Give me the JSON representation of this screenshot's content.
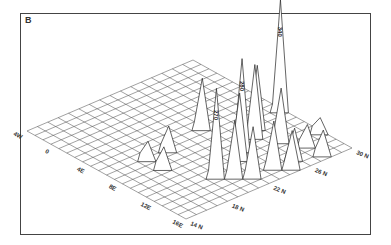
{
  "panel_label": "B",
  "chart_data": {
    "type": "3d-surface",
    "title": "",
    "panel": "B",
    "x_axis": {
      "label": "Longitude",
      "ticks": [
        "4W",
        "0",
        "4E",
        "8E",
        "12E",
        "16E"
      ],
      "range": [
        -4,
        16
      ]
    },
    "y_axis": {
      "label": "Latitude",
      "ticks": [
        "14 N",
        "18 N",
        "22 N",
        "26 N",
        "30 N"
      ],
      "range": [
        14,
        30
      ]
    },
    "labeled_peaks": [
      {
        "label": "340",
        "lon": 7,
        "lat": 30,
        "value": 340
      },
      {
        "label": "280",
        "lon": 10,
        "lat": 24,
        "value": 280
      },
      {
        "label": "270",
        "lon": 12,
        "lat": 20,
        "value": 270
      }
    ],
    "peaks": [
      {
        "lon": 7,
        "lat": 30,
        "value": 340
      },
      {
        "lon": 10,
        "lat": 24,
        "value": 280
      },
      {
        "lon": 12,
        "lat": 20,
        "value": 270
      },
      {
        "lon": 9,
        "lat": 26,
        "value": 220
      },
      {
        "lon": 8,
        "lat": 27,
        "value": 190
      },
      {
        "lon": 11,
        "lat": 23,
        "value": 200
      },
      {
        "lon": 13,
        "lat": 21,
        "value": 170
      },
      {
        "lon": 14,
        "lat": 22,
        "value": 150
      },
      {
        "lon": 14,
        "lat": 24,
        "value": 140
      },
      {
        "lon": 11,
        "lat": 27,
        "value": 160
      },
      {
        "lon": 5,
        "lat": 24,
        "value": 150
      },
      {
        "lon": 6,
        "lat": 20,
        "value": 70
      },
      {
        "lon": 8,
        "lat": 18,
        "value": 60
      },
      {
        "lon": 6,
        "lat": 18,
        "value": 50
      },
      {
        "lon": 14,
        "lat": 26,
        "value": 90
      },
      {
        "lon": 15,
        "lat": 25,
        "value": 110
      },
      {
        "lon": 13,
        "lat": 28,
        "value": 60
      },
      {
        "lon": 12,
        "lat": 30,
        "value": 40
      },
      {
        "lon": 15,
        "lat": 28,
        "value": 70
      }
    ],
    "grid": true
  }
}
